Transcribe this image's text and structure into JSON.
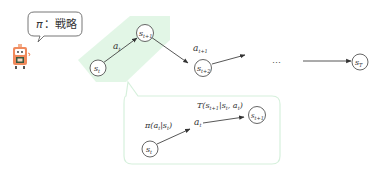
{
  "diagram": {
    "policy_bubble": {
      "symbol": "π",
      "separator": "：",
      "label": "戦略"
    },
    "agent_icon": "robot-icon",
    "colors": {
      "highlight": "#d8f3dc",
      "callout_border": "#d6f0dc",
      "robot_body": "#f08a5d",
      "node_stroke": "#555555"
    },
    "main_chain": {
      "nodes": [
        {
          "id": "st",
          "base": "s",
          "sub": "t"
        },
        {
          "id": "st1",
          "base": "s",
          "sub": "t+1"
        },
        {
          "id": "st2",
          "base": "s",
          "sub": "t+2"
        },
        {
          "id": "sT",
          "base": "s",
          "sub": "T"
        }
      ],
      "edge_labels": [
        {
          "base": "a",
          "sub": "t"
        },
        {
          "base": "a",
          "sub": "t+1"
        }
      ],
      "ellipsis": "…"
    },
    "detail": {
      "node_start": {
        "base": "s",
        "sub": "t"
      },
      "node_end": {
        "base": "s",
        "sub": "t+1"
      },
      "action": {
        "base": "a",
        "sub": "t"
      },
      "policy_expr": "π(a_t|s_t)",
      "policy_parts": {
        "pre": "π(a",
        "sub1": "t",
        "mid": "|s",
        "sub2": "t",
        "post": ")"
      },
      "transition_expr": "T(s_{t+1}|s_t, a_t)",
      "transition_parts": {
        "pre": "T(s",
        "sub1": "t+1",
        "mid": "|s",
        "sub2": "t",
        "mid2": ", a",
        "sub3": "t",
        "post": ")"
      }
    }
  }
}
